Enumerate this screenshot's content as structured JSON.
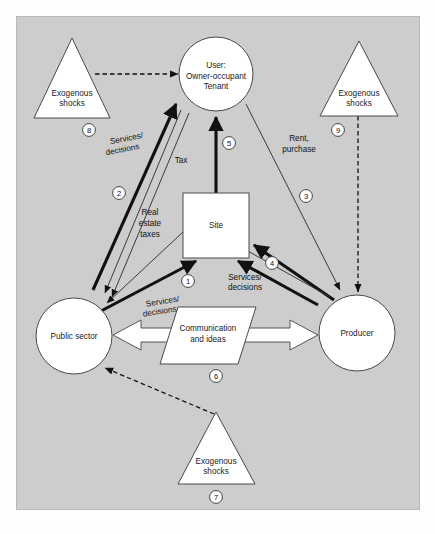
{
  "diagram": {
    "background_color": "#cdcdcd",
    "shape_fill": "#ffffff",
    "nodes": {
      "user": {
        "name": "user-node",
        "shape": "circle",
        "lines": [
          "User:",
          "Owner-occupant",
          "Tenant"
        ]
      },
      "site": {
        "name": "site-node",
        "shape": "square",
        "lines": [
          "Site"
        ]
      },
      "public_sector": {
        "name": "public-sector-node",
        "shape": "circle",
        "lines": [
          "Public sector"
        ]
      },
      "producer": {
        "name": "producer-node",
        "shape": "circle",
        "lines": [
          "Producer"
        ]
      },
      "shock_left": {
        "name": "exogenous-shocks-left",
        "shape": "triangle",
        "lines": [
          "Exogenous",
          "shocks"
        ],
        "number": "8"
      },
      "shock_right": {
        "name": "exogenous-shocks-right",
        "shape": "triangle",
        "lines": [
          "Exogenous",
          "shocks"
        ],
        "number": "9"
      },
      "shock_bottom": {
        "name": "exogenous-shocks-bottom",
        "shape": "triangle",
        "lines": [
          "Exogenous",
          "shocks"
        ],
        "number": "7"
      },
      "communication": {
        "name": "communication-node",
        "shape": "parallelogram",
        "lines": [
          "Communication",
          "and ideas"
        ],
        "number": "6"
      }
    },
    "edge_labels": {
      "services_decisions_user": {
        "lines": [
          "Services/",
          "decisions"
        ]
      },
      "tax": {
        "lines": [
          "Tax"
        ]
      },
      "real_estate_taxes": {
        "lines": [
          "Real",
          "estate",
          "taxes"
        ]
      },
      "rent_purchase": {
        "lines": [
          "Rent,",
          "purchase"
        ]
      },
      "services_decisions_public": {
        "lines": [
          "Services/",
          "decisions"
        ]
      },
      "services_decisions_producer": {
        "lines": [
          "Services/",
          "decisions"
        ]
      }
    },
    "numbers": {
      "n1": "1",
      "n2": "2",
      "n3": "3",
      "n4": "4",
      "n5": "5",
      "n6": "6",
      "n7": "7",
      "n8": "8",
      "n9": "9"
    }
  }
}
